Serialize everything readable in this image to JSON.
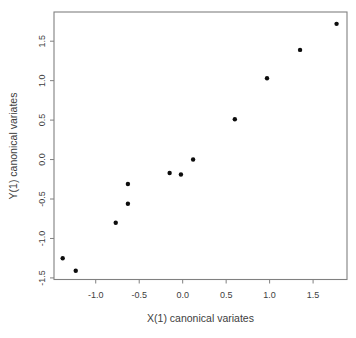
{
  "figure": {
    "background": "#ffffff"
  },
  "chart_data": {
    "type": "scatter",
    "title": "",
    "xlabel": "X(1) canonical variates",
    "ylabel": "Y(1) canonical variates",
    "xlim": [
      -1.48,
      1.89
    ],
    "ylim": [
      -1.52,
      1.87
    ],
    "x_ticks": [
      -1.0,
      -0.5,
      0.0,
      0.5,
      1.0,
      1.5
    ],
    "x_tick_labels": [
      "-1.0",
      "-0.5",
      "0.0",
      "0.5",
      "1.0",
      "1.5"
    ],
    "y_ticks": [
      -1.5,
      -1.0,
      -0.5,
      0.0,
      0.5,
      1.0,
      1.5
    ],
    "y_tick_labels": [
      "-1.5",
      "-1.0",
      "-0.5",
      "0.0",
      "0.5",
      "1.0",
      "1.5"
    ],
    "grid": false,
    "legend_position": "none",
    "marker": "filled-circle",
    "points": [
      {
        "x": -1.38,
        "y": -1.25
      },
      {
        "x": -1.23,
        "y": -1.41
      },
      {
        "x": -0.77,
        "y": -0.8
      },
      {
        "x": -0.63,
        "y": -0.56
      },
      {
        "x": -0.63,
        "y": -0.31
      },
      {
        "x": -0.15,
        "y": -0.17
      },
      {
        "x": -0.02,
        "y": -0.19
      },
      {
        "x": 0.12,
        "y": 0.0
      },
      {
        "x": 0.6,
        "y": 0.51
      },
      {
        "x": 0.97,
        "y": 1.03
      },
      {
        "x": 1.35,
        "y": 1.39
      },
      {
        "x": 1.77,
        "y": 1.72
      }
    ],
    "colors": {
      "point": "#0d0d0d",
      "axis": "#808080",
      "text": "#404040",
      "background": "#ffffff"
    }
  }
}
